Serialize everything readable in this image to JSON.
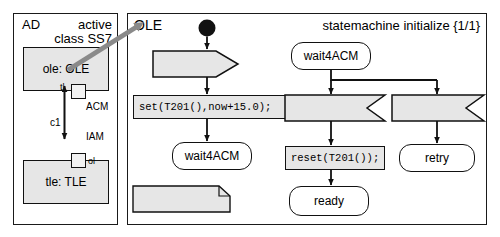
{
  "left_panel": {
    "name": "AD",
    "stereotype": "active\nclass SS7",
    "parts": [
      {
        "id": "ole",
        "label": "ole: OLE"
      },
      {
        "id": "tle",
        "label": "tle: TLE"
      }
    ],
    "ports": [
      {
        "id": "tl",
        "label": "tl"
      },
      {
        "id": "ol",
        "label": "ol"
      }
    ],
    "connector": {
      "name": "c1",
      "upper_signal": "ACM",
      "lower_signal": "IAM"
    }
  },
  "right_panel": {
    "name": "OLE",
    "statemachine_label": "statemachine initialize {1/1}",
    "initial_node": "initial-state-circle",
    "nodes": [
      {
        "id": "iam",
        "kind": "signal-receipt",
        "label": "IAM()"
      },
      {
        "id": "set",
        "kind": "action",
        "label": "set(T201(),now+15.0);"
      },
      {
        "id": "wait4acm_1",
        "kind": "state",
        "label": "wait4ACM"
      },
      {
        "id": "timer",
        "kind": "note",
        "label": "timer T201;"
      },
      {
        "id": "wait4acm_2",
        "kind": "state",
        "label": "wait4ACM"
      },
      {
        "id": "acm",
        "kind": "signal-receipt",
        "label": "ACM()"
      },
      {
        "id": "reset",
        "kind": "action",
        "label": "reset(T201());"
      },
      {
        "id": "ready",
        "kind": "state",
        "label": "ready"
      },
      {
        "id": "t201",
        "kind": "signal-receipt",
        "label": "T201()"
      },
      {
        "id": "retry",
        "kind": "state",
        "label": "retry"
      }
    ]
  },
  "colors": {
    "shape_fill": "#e6e6e6",
    "state_fill": "#ffffff",
    "stroke": "#111111",
    "pointer_arrow": "#808080"
  }
}
